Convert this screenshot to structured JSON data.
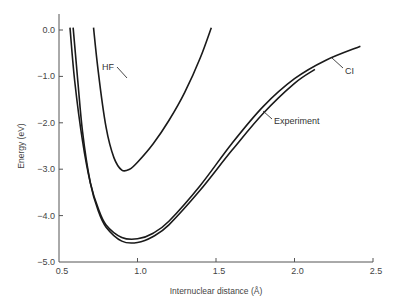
{
  "chart_data": {
    "type": "line",
    "title": "",
    "xlabel": "Internuclear distance (Å)",
    "ylabel": "Energy (eV)",
    "xlim": [
      0.5,
      2.5
    ],
    "ylim": [
      -5.0,
      0.0
    ],
    "grid": false,
    "legend": "none (inline annotations)",
    "x_ticks": [
      "0.5",
      "1.0",
      "1.5",
      "2.0",
      "2.5"
    ],
    "y_ticks": [
      "0.0",
      "-1.0",
      "-2.0",
      "-3.0",
      "-4.0",
      "-5.0"
    ],
    "series": [
      {
        "name": "HF",
        "x": [
          0.72,
          0.75,
          0.8,
          0.85,
          0.9,
          0.95,
          1.0,
          1.1,
          1.2,
          1.3,
          1.4,
          1.47
        ],
        "y": [
          0.05,
          -0.9,
          -2.1,
          -2.75,
          -3.02,
          -3.0,
          -2.85,
          -2.45,
          -1.95,
          -1.35,
          -0.6,
          0.05
        ]
      },
      {
        "name": "CI",
        "x": [
          0.57,
          0.6,
          0.65,
          0.7,
          0.75,
          0.8,
          0.9,
          1.0,
          1.1,
          1.2,
          1.4,
          1.6,
          1.8,
          2.0,
          2.2,
          2.42
        ],
        "y": [
          0.05,
          -1.1,
          -2.4,
          -3.3,
          -3.85,
          -4.2,
          -4.47,
          -4.5,
          -4.38,
          -4.12,
          -3.35,
          -2.45,
          -1.65,
          -1.05,
          -0.65,
          -0.35
        ]
      },
      {
        "name": "Experiment",
        "x": [
          0.59,
          0.62,
          0.65,
          0.7,
          0.75,
          0.8,
          0.9,
          1.0,
          1.1,
          1.2,
          1.4,
          1.6,
          1.8,
          2.0,
          2.13
        ],
        "y": [
          0.05,
          -1.1,
          -2.2,
          -3.3,
          -3.9,
          -4.25,
          -4.55,
          -4.58,
          -4.45,
          -4.2,
          -3.45,
          -2.6,
          -1.8,
          -1.15,
          -0.85
        ]
      }
    ],
    "annotations": [
      {
        "text": "HF",
        "points_to": "HF",
        "at_x": 1.33,
        "at_y": -1.0
      },
      {
        "text": "CI",
        "points_to": "CI",
        "at_x": 2.3,
        "at_y": -0.5
      },
      {
        "text": "Experiment",
        "points_to": "Experiment",
        "at_x": 1.83,
        "at_y": -1.8
      }
    ],
    "line_color": "#1a1a1a"
  },
  "labels": {
    "x_axis_title": "Internuclear distance (Å)",
    "y_axis_title": "Energy (eV)",
    "annot_hf": "HF",
    "annot_ci": "CI",
    "annot_exp": "Experiment"
  }
}
